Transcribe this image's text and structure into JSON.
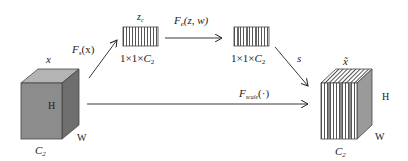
{
  "diagram": {
    "input_block": {
      "label": "x",
      "height_label": "H",
      "width_label": "W",
      "channel_label": "C",
      "channel_sub": "2",
      "fill_front": "#8c8c8c",
      "fill_top": "#b4b4b4",
      "fill_side": "#6e6e6e"
    },
    "squeeze_arrow": {
      "label_main": "F",
      "label_sub": "s",
      "label_arg": "(x)"
    },
    "squeeze_vector": {
      "label_main": "z",
      "label_sub": "c",
      "dims_prefix": "1×1×",
      "dims_main": "C",
      "dims_sub": "2"
    },
    "excite_arrow": {
      "label_main": "F",
      "label_sub": "e",
      "label_arg": "(z, w)"
    },
    "excite_vector": {
      "dims_prefix": "1×1×",
      "dims_main": "C",
      "dims_sub": "2"
    },
    "scale_arrow_diag": {
      "label": "s"
    },
    "scale_arrow": {
      "label_main": "F",
      "label_sub": "scale",
      "label_arg": "(·)"
    },
    "output_block": {
      "label": "x̃",
      "height_label": "H",
      "width_label": "W",
      "channel_label": "C",
      "channel_sub": "2",
      "fill_side": "#9a9a9a"
    }
  }
}
